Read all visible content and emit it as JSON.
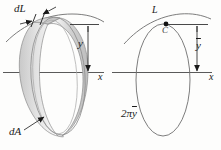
{
  "figure": {
    "background_color": "#fdfdfc",
    "ink_color": "#1a1a1a",
    "line_color": "#555555",
    "left_panel": {
      "name": "pappus-surface-of-revolution-ring",
      "labels": {
        "dL": "dL",
        "y": "y",
        "dA": "dA",
        "x_axis": "x"
      }
    },
    "right_panel": {
      "name": "pappus-centroid-equivalent-ring",
      "labels": {
        "L": "L",
        "C": "C",
        "y_bar": "y",
        "circumference": "2π",
        "circumference_bar": "y",
        "x_axis": "x"
      }
    }
  }
}
